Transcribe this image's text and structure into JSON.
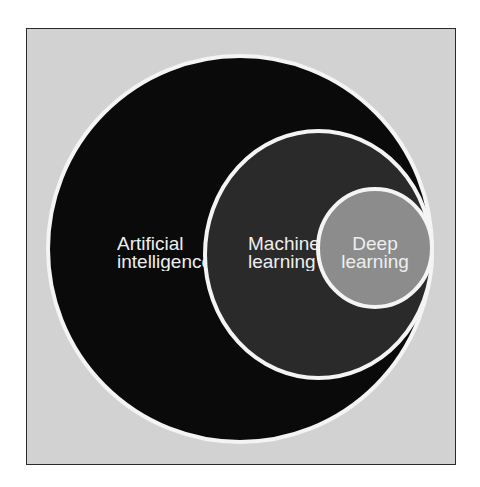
{
  "diagram": {
    "type": "nested-venn",
    "colors": {
      "background": "#d2d2d2",
      "frame_border": "#2a2a2a",
      "stroke": "#f4f4f4",
      "ai_fill": "#0a0a0a",
      "ml_fill": "#2a2a2a",
      "dl_fill": "#8c8c8c",
      "text": "#eeeeee"
    },
    "circles": [
      {
        "id": "ai",
        "label_line1": "Artificial",
        "label_line2": "intelligence"
      },
      {
        "id": "ml",
        "label_line1": "Machine",
        "label_line2": "learning"
      },
      {
        "id": "dl",
        "label_line1": "Deep",
        "label_line2": "learning"
      }
    ]
  }
}
